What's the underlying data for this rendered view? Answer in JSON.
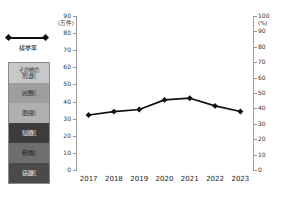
{
  "legend": {
    "line": {
      "label": "検挙率",
      "icon": "line-with-diamond-markers",
      "color": "#111111"
    },
    "series": [
      {
        "label": "その他の\n刑法犯",
        "key": "other",
        "color": "#c8c8c8"
      },
      {
        "label": "凶悪犯",
        "key": "violent",
        "color": "#9e9e9e"
      },
      {
        "label": "風俗犯",
        "key": "vice",
        "color": "#b0b0b0"
      },
      {
        "label": "知能犯",
        "key": "intellect",
        "color": "#3c3c3c"
      },
      {
        "label": "粗暴犯",
        "key": "rough",
        "color": "#6e6e6e"
      },
      {
        "label": "窃盗犯",
        "key": "theft",
        "color": "#4a4a4a"
      }
    ]
  },
  "chart_data": {
    "type": "bar",
    "subtype": "stacked-bar-with-line-overlay",
    "title": "",
    "xlabel": "",
    "ylabel": "",
    "categories": [
      "2017",
      "2018",
      "2019",
      "2020",
      "2021",
      "2022",
      "2023"
    ],
    "left_axis": {
      "unit": "(万件)",
      "ylim": [
        0,
        90
      ],
      "ticks": [
        0,
        10,
        20,
        30,
        40,
        50,
        60,
        70,
        80,
        90
      ]
    },
    "right_axis": {
      "unit": "(%)",
      "ylim": [
        0,
        100
      ],
      "ticks": [
        0,
        10,
        20,
        30,
        40,
        50,
        60,
        70,
        80,
        90,
        100
      ]
    },
    "grid": false,
    "legend_position": "left",
    "series": [
      {
        "name": "窃盗犯",
        "axis": "left",
        "values": [
          65.5,
          58.0,
          53.2,
          41.8,
          38.2,
          40.7,
          47.5
        ]
      },
      {
        "name": "粗暴犯",
        "axis": "left",
        "values": [
          5.2,
          4.9,
          4.7,
          4.2,
          4.0,
          4.3,
          4.6
        ]
      },
      {
        "name": "知能犯",
        "axis": "left",
        "values": [
          4.8,
          4.5,
          4.2,
          3.3,
          3.0,
          3.3,
          3.8
        ]
      },
      {
        "name": "風俗犯",
        "axis": "left",
        "values": [
          0.9,
          0.9,
          0.9,
          0.8,
          0.8,
          0.9,
          1.0
        ]
      },
      {
        "name": "凶悪犯",
        "axis": "left",
        "values": [
          0.6,
          0.6,
          0.6,
          0.5,
          0.5,
          0.6,
          0.6
        ]
      },
      {
        "name": "その他の刑法犯",
        "axis": "left",
        "values": [
          12.5,
          12.7,
          11.4,
          9.9,
          9.3,
          10.0,
          11.5
        ]
      }
    ],
    "totals": [
      89.5,
      81.6,
      75.0,
      60.5,
      55.8,
      59.8,
      69.0
    ],
    "line": {
      "name": "検挙率",
      "axis": "right",
      "unit": "%",
      "values": [
        35.7,
        37.9,
        39.3,
        45.5,
        46.6,
        41.6,
        38.0
      ]
    }
  }
}
